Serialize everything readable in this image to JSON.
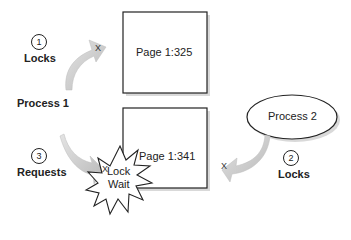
{
  "diagram": {
    "pages": [
      {
        "label": "Page 1:325"
      },
      {
        "label": "Page 1:341"
      }
    ],
    "processes": [
      {
        "label": "Process 1"
      },
      {
        "label": "Process 2"
      }
    ],
    "steps": [
      {
        "number": "1",
        "label": "Locks"
      },
      {
        "number": "2",
        "label": "Locks"
      },
      {
        "number": "3",
        "label": "Requests"
      }
    ],
    "lock_wait": {
      "line1": "Lock",
      "line2": "Wait"
    },
    "lock_marker": "X",
    "colors": {
      "arrow_fill": "#c8c8c8",
      "arrow_shadow": "#e6e6e6",
      "stroke": "#222222",
      "shadow": "#d9d9d9"
    }
  }
}
